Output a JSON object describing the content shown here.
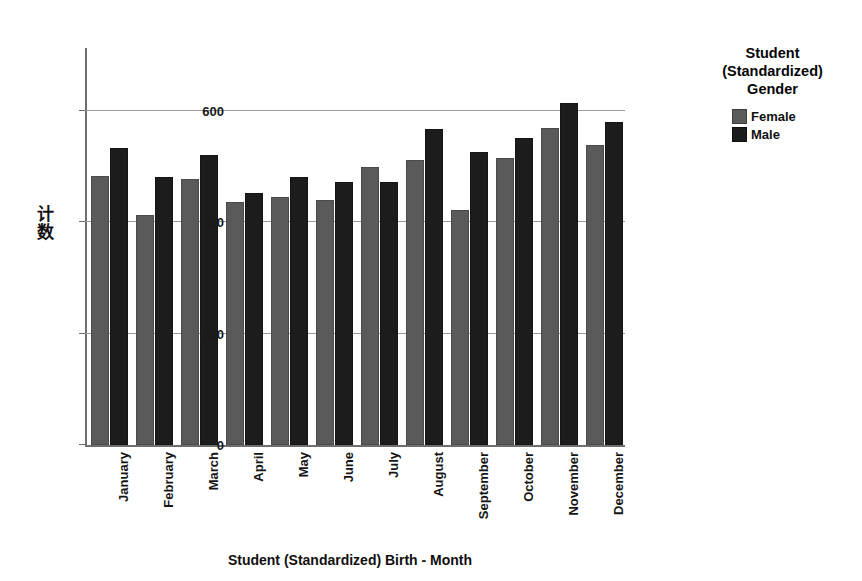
{
  "chart_data": {
    "type": "bar",
    "title": "",
    "xlabel": "Student (Standardized) Birth - Month",
    "ylabel": "计数",
    "categories": [
      "January",
      "February",
      "March",
      "April",
      "May",
      "June",
      "July",
      "August",
      "September",
      "October",
      "November",
      "December"
    ],
    "series": [
      {
        "name": "Female",
        "color": "#5a5a5a",
        "values": [
          484,
          414,
          478,
          437,
          445,
          440,
          500,
          512,
          423,
          515,
          570,
          539
        ]
      },
      {
        "name": "Male",
        "color": "#1c1c1c",
        "values": [
          533,
          481,
          521,
          452,
          481,
          472,
          472,
          568,
          526,
          552,
          615,
          581
        ]
      }
    ],
    "ylim": [
      0,
      640
    ],
    "yticks": [
      0,
      200,
      400,
      600
    ],
    "ytick_labels": [
      "0",
      "200",
      "400",
      "600"
    ],
    "grid": true,
    "legend_position": "right",
    "legend_title": [
      "Student",
      "(Standardized)",
      "Gender"
    ]
  },
  "axes": {
    "y_title_chars": [
      "计",
      "数"
    ],
    "x_title": "Student (Standardized) Birth - Month"
  },
  "legend": {
    "title_lines": [
      "Student",
      "(Standardized)",
      "Gender"
    ],
    "entries": [
      {
        "label": "Female",
        "color": "#5a5a5a"
      },
      {
        "label": "Male",
        "color": "#1c1c1c"
      }
    ]
  }
}
